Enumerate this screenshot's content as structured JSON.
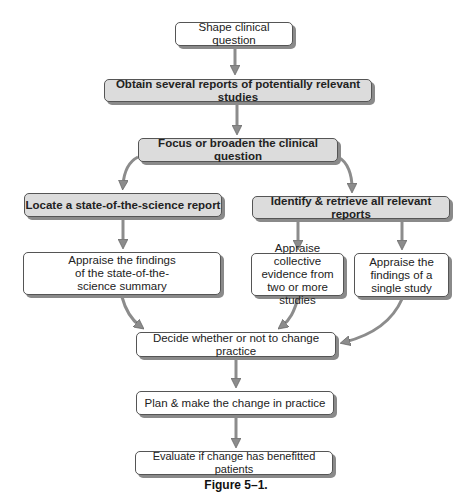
{
  "diagram": {
    "nodes": [
      {
        "id": "shape",
        "label": "Shape clinical question",
        "style": "plain"
      },
      {
        "id": "obtain",
        "label": "Obtain several reports of potentially relevant studies",
        "style": "shaded"
      },
      {
        "id": "focus",
        "label": "Focus or broaden the clinical question",
        "style": "shaded"
      },
      {
        "id": "locate",
        "label": "Locate a state-of-the-science report",
        "style": "shaded"
      },
      {
        "id": "identify",
        "label": "Identify & retrieve all relevant reports",
        "style": "shaded"
      },
      {
        "id": "appraise_summary",
        "label": "Appraise the findings of the state-of-the-science summary",
        "style": "plain"
      },
      {
        "id": "appraise_collective",
        "label": "Appraise collective evidence from two or more studies",
        "style": "plain"
      },
      {
        "id": "appraise_single",
        "label": "Appraise the findings of a single study",
        "style": "plain"
      },
      {
        "id": "decide",
        "label": "Decide whether or not to change practice",
        "style": "plain"
      },
      {
        "id": "plan",
        "label": "Plan & make the change in practice",
        "style": "plain"
      },
      {
        "id": "evaluate",
        "label": "Evaluate if change has benefitted patients",
        "style": "plain"
      }
    ],
    "edges": [
      [
        "shape",
        "obtain"
      ],
      [
        "obtain",
        "focus"
      ],
      [
        "focus",
        "locate"
      ],
      [
        "focus",
        "identify"
      ],
      [
        "locate",
        "appraise_summary"
      ],
      [
        "identify",
        "appraise_collective"
      ],
      [
        "identify",
        "appraise_single"
      ],
      [
        "appraise_summary",
        "decide"
      ],
      [
        "appraise_collective",
        "decide"
      ],
      [
        "appraise_single",
        "decide"
      ],
      [
        "decide",
        "plan"
      ],
      [
        "plan",
        "evaluate"
      ]
    ],
    "caption": "Figure 5–1."
  },
  "colors": {
    "shaded_fill": "#dcdcdc",
    "border": "#555555",
    "shadow": "#8a8a8a",
    "arrow": "#8c8c8c"
  }
}
